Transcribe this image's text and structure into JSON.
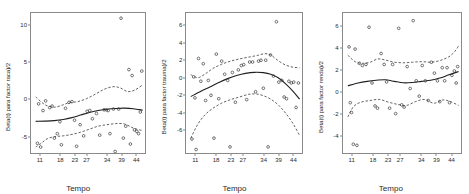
{
  "figure": {
    "type": "multi-panel-scatter-smooth",
    "panel_count": 3,
    "background": "#ffffff",
    "axis_color": "#8a8a8a",
    "fit_color": "#1f1f1f",
    "band_color": "#3a3a3a",
    "point_color": "#3a3a3a"
  },
  "chart_data": [
    {
      "type": "scatter",
      "title": "",
      "panel_index": 0,
      "ylabel": "Beta(t) para factor raca)/2",
      "xlabel": "Tempo",
      "xticks": [
        11,
        18,
        23,
        27,
        34,
        39,
        44
      ],
      "yticks": [
        -5,
        0,
        5,
        10
      ],
      "xlim": [
        8,
        47
      ],
      "ylim": [
        -7.2,
        11.6
      ],
      "grid": false,
      "legend": "none",
      "points": [
        {
          "x": 10.2,
          "y": -5.9
        },
        {
          "x": 10.6,
          "y": -0.6
        },
        {
          "x": 11.3,
          "y": -6.4
        },
        {
          "x": 12.1,
          "y": -1.5
        },
        {
          "x": 13.0,
          "y": -0.2
        },
        {
          "x": 14.4,
          "y": -1.1
        },
        {
          "x": 15.2,
          "y": -0.9
        },
        {
          "x": 16.0,
          "y": -5.2
        },
        {
          "x": 17.0,
          "y": -4.6
        },
        {
          "x": 17.9,
          "y": -3.0
        },
        {
          "x": 18.4,
          "y": -6.1
        },
        {
          "x": 19.8,
          "y": -1.2
        },
        {
          "x": 21.0,
          "y": -0.4
        },
        {
          "x": 22.0,
          "y": -0.3
        },
        {
          "x": 22.9,
          "y": -2.8
        },
        {
          "x": 23.6,
          "y": -6.3
        },
        {
          "x": 24.8,
          "y": -3.4
        },
        {
          "x": 26.0,
          "y": -4.9
        },
        {
          "x": 27.2,
          "y": -1.6
        },
        {
          "x": 28.1,
          "y": -1.5
        },
        {
          "x": 29.0,
          "y": -2.6
        },
        {
          "x": 30.4,
          "y": -1.9
        },
        {
          "x": 31.5,
          "y": -4.8
        },
        {
          "x": 33.0,
          "y": -1.4
        },
        {
          "x": 33.8,
          "y": -1.4
        },
        {
          "x": 34.4,
          "y": -1.5
        },
        {
          "x": 35.0,
          "y": -4.6
        },
        {
          "x": 36.2,
          "y": -1.3
        },
        {
          "x": 36.8,
          "y": -7.0
        },
        {
          "x": 38.0,
          "y": -1.3
        },
        {
          "x": 38.8,
          "y": 10.9
        },
        {
          "x": 39.6,
          "y": -5.2
        },
        {
          "x": 40.4,
          "y": -3.6
        },
        {
          "x": 41.5,
          "y": 4.0
        },
        {
          "x": 42.0,
          "y": -6.0
        },
        {
          "x": 42.6,
          "y": 3.2
        },
        {
          "x": 43.4,
          "y": -4.1
        },
        {
          "x": 44.2,
          "y": -4.3
        },
        {
          "x": 44.8,
          "y": -4.6
        },
        {
          "x": 45.4,
          "y": -1.7
        },
        {
          "x": 45.9,
          "y": 3.8
        }
      ],
      "fit": [
        {
          "x": 9.6,
          "y": -2.95
        },
        {
          "x": 13.0,
          "y": -2.92
        },
        {
          "x": 16.0,
          "y": -2.85
        },
        {
          "x": 19.0,
          "y": -2.7
        },
        {
          "x": 22.0,
          "y": -2.45
        },
        {
          "x": 25.0,
          "y": -2.1
        },
        {
          "x": 28.0,
          "y": -1.75
        },
        {
          "x": 31.0,
          "y": -1.5
        },
        {
          "x": 34.0,
          "y": -1.32
        },
        {
          "x": 37.0,
          "y": -1.22
        },
        {
          "x": 40.0,
          "y": -1.18
        },
        {
          "x": 43.0,
          "y": -1.25
        },
        {
          "x": 46.2,
          "y": -1.45
        }
      ],
      "upper_band": [
        {
          "x": 9.6,
          "y": 0.35
        },
        {
          "x": 11.5,
          "y": -0.35
        },
        {
          "x": 13.5,
          "y": -0.85
        },
        {
          "x": 16.0,
          "y": -1.05
        },
        {
          "x": 18.5,
          "y": -0.8
        },
        {
          "x": 21.0,
          "y": -0.45
        },
        {
          "x": 24.0,
          "y": -0.3
        },
        {
          "x": 27.0,
          "y": 0.1
        },
        {
          "x": 30.0,
          "y": 0.7
        },
        {
          "x": 33.0,
          "y": 1.35
        },
        {
          "x": 36.0,
          "y": 1.7
        },
        {
          "x": 38.5,
          "y": 1.55
        },
        {
          "x": 41.0,
          "y": 1.05
        },
        {
          "x": 43.5,
          "y": 1.25
        },
        {
          "x": 46.2,
          "y": 1.95
        }
      ],
      "lower_band": [
        {
          "x": 9.6,
          "y": -6.4
        },
        {
          "x": 11.5,
          "y": -5.9
        },
        {
          "x": 13.5,
          "y": -5.3
        },
        {
          "x": 16.0,
          "y": -5.0
        },
        {
          "x": 19.0,
          "y": -4.9
        },
        {
          "x": 22.0,
          "y": -4.7
        },
        {
          "x": 25.0,
          "y": -4.4
        },
        {
          "x": 28.0,
          "y": -4.0
        },
        {
          "x": 31.0,
          "y": -3.6
        },
        {
          "x": 34.0,
          "y": -3.4
        },
        {
          "x": 37.0,
          "y": -3.25
        },
        {
          "x": 40.0,
          "y": -3.3
        },
        {
          "x": 43.0,
          "y": -3.85
        },
        {
          "x": 46.2,
          "y": -4.2
        }
      ]
    },
    {
      "type": "scatter",
      "title": "",
      "panel_index": 1,
      "ylabel": "Beta(t) para factor trauma)/2",
      "xlabel": "Tempo",
      "xticks": [
        11,
        18,
        23,
        27,
        34,
        39,
        44
      ],
      "yticks": [
        -6,
        -4,
        -2,
        0,
        2,
        4,
        6
      ],
      "xlim": [
        8,
        47
      ],
      "ylim": [
        -8.6,
        7.4
      ],
      "grid": false,
      "legend": "none",
      "points": [
        {
          "x": 10.0,
          "y": -7.0
        },
        {
          "x": 10.6,
          "y": 0.1
        },
        {
          "x": 11.0,
          "y": -2.3
        },
        {
          "x": 11.4,
          "y": -8.2
        },
        {
          "x": 12.2,
          "y": 2.2
        },
        {
          "x": 13.0,
          "y": -0.4
        },
        {
          "x": 13.8,
          "y": 1.6
        },
        {
          "x": 14.6,
          "y": -2.6
        },
        {
          "x": 15.5,
          "y": -0.3
        },
        {
          "x": 16.4,
          "y": -2.0
        },
        {
          "x": 17.4,
          "y": -6.9
        },
        {
          "x": 18.2,
          "y": 2.7
        },
        {
          "x": 19.0,
          "y": -2.4
        },
        {
          "x": 20.0,
          "y": 1.9
        },
        {
          "x": 21.0,
          "y": 0.4
        },
        {
          "x": 22.0,
          "y": -0.3
        },
        {
          "x": 22.8,
          "y": -7.9
        },
        {
          "x": 23.6,
          "y": 0.6
        },
        {
          "x": 24.6,
          "y": -2.8
        },
        {
          "x": 25.6,
          "y": 0.9
        },
        {
          "x": 26.6,
          "y": 1.4
        },
        {
          "x": 27.4,
          "y": 1.5
        },
        {
          "x": 28.4,
          "y": -2.5
        },
        {
          "x": 29.4,
          "y": 1.8
        },
        {
          "x": 30.4,
          "y": 1.8
        },
        {
          "x": 31.4,
          "y": -1.6
        },
        {
          "x": 32.4,
          "y": 1.9
        },
        {
          "x": 33.2,
          "y": 2.0
        },
        {
          "x": 34.0,
          "y": -1.2
        },
        {
          "x": 34.8,
          "y": 2.0
        },
        {
          "x": 35.6,
          "y": -7.9
        },
        {
          "x": 36.4,
          "y": 2.6
        },
        {
          "x": 37.4,
          "y": 0.2
        },
        {
          "x": 38.4,
          "y": 6.4
        },
        {
          "x": 39.2,
          "y": -0.5
        },
        {
          "x": 40.2,
          "y": -0.3
        },
        {
          "x": 41.0,
          "y": -2.2
        },
        {
          "x": 41.8,
          "y": -2.4
        },
        {
          "x": 42.6,
          "y": -0.4
        },
        {
          "x": 43.4,
          "y": -0.6
        },
        {
          "x": 44.2,
          "y": -0.5
        },
        {
          "x": 45.0,
          "y": -3.4
        },
        {
          "x": 45.8,
          "y": -0.6
        }
      ],
      "fit": [
        {
          "x": 9.6,
          "y": -2.15
        },
        {
          "x": 13.0,
          "y": -1.55
        },
        {
          "x": 16.0,
          "y": -1.05
        },
        {
          "x": 19.0,
          "y": -0.55
        },
        {
          "x": 22.0,
          "y": -0.1
        },
        {
          "x": 25.0,
          "y": 0.25
        },
        {
          "x": 28.0,
          "y": 0.5
        },
        {
          "x": 31.0,
          "y": 0.62
        },
        {
          "x": 34.0,
          "y": 0.58
        },
        {
          "x": 36.5,
          "y": 0.4
        },
        {
          "x": 39.0,
          "y": 0.0
        },
        {
          "x": 41.5,
          "y": -0.7
        },
        {
          "x": 44.0,
          "y": -1.55
        },
        {
          "x": 46.2,
          "y": -2.45
        }
      ],
      "upper_band": [
        {
          "x": 9.6,
          "y": 0.35
        },
        {
          "x": 12.0,
          "y": 0.0
        },
        {
          "x": 14.5,
          "y": 0.45
        },
        {
          "x": 17.0,
          "y": 1.05
        },
        {
          "x": 20.0,
          "y": 1.55
        },
        {
          "x": 23.0,
          "y": 1.9
        },
        {
          "x": 26.0,
          "y": 2.15
        },
        {
          "x": 29.0,
          "y": 2.35
        },
        {
          "x": 32.0,
          "y": 2.55
        },
        {
          "x": 34.5,
          "y": 2.75
        },
        {
          "x": 36.5,
          "y": 2.6
        },
        {
          "x": 39.0,
          "y": 1.95
        },
        {
          "x": 41.5,
          "y": 1.45
        },
        {
          "x": 44.0,
          "y": 1.2
        },
        {
          "x": 46.2,
          "y": 1.15
        }
      ],
      "lower_band": [
        {
          "x": 9.6,
          "y": -6.9
        },
        {
          "x": 12.0,
          "y": -5.3
        },
        {
          "x": 14.5,
          "y": -4.2
        },
        {
          "x": 17.0,
          "y": -3.5
        },
        {
          "x": 20.0,
          "y": -2.9
        },
        {
          "x": 23.0,
          "y": -2.5
        },
        {
          "x": 26.0,
          "y": -2.2
        },
        {
          "x": 29.0,
          "y": -1.9
        },
        {
          "x": 31.5,
          "y": -1.85
        },
        {
          "x": 34.0,
          "y": -2.05
        },
        {
          "x": 36.5,
          "y": -2.45
        },
        {
          "x": 39.0,
          "y": -3.1
        },
        {
          "x": 41.5,
          "y": -4.05
        },
        {
          "x": 44.0,
          "y": -5.25
        },
        {
          "x": 46.2,
          "y": -6.6
        }
      ]
    },
    {
      "type": "scatter",
      "title": "",
      "panel_index": 2,
      "ylabel": "Beta(t) para factor renda)/2",
      "xlabel": "Tempo",
      "xticks": [
        11,
        18,
        23,
        27,
        34,
        39,
        44
      ],
      "yticks": [
        -4,
        -2,
        0,
        2,
        4,
        6
      ],
      "xlim": [
        8,
        47
      ],
      "ylim": [
        -5.6,
        7.2
      ],
      "grid": false,
      "legend": "none",
      "points": [
        {
          "x": 10.0,
          "y": 4.1
        },
        {
          "x": 10.4,
          "y": -1.0
        },
        {
          "x": 10.8,
          "y": -1.9
        },
        {
          "x": 11.4,
          "y": -4.8
        },
        {
          "x": 12.0,
          "y": 3.9
        },
        {
          "x": 12.6,
          "y": -4.9
        },
        {
          "x": 13.4,
          "y": 2.6
        },
        {
          "x": 14.4,
          "y": 2.4
        },
        {
          "x": 15.6,
          "y": 2.5
        },
        {
          "x": 16.6,
          "y": 5.9
        },
        {
          "x": 17.6,
          "y": 0.8
        },
        {
          "x": 18.6,
          "y": -1.3
        },
        {
          "x": 19.4,
          "y": -1.5
        },
        {
          "x": 20.6,
          "y": 3.5
        },
        {
          "x": 21.6,
          "y": 2.5
        },
        {
          "x": 22.4,
          "y": 0.9
        },
        {
          "x": 23.4,
          "y": -1.5
        },
        {
          "x": 24.4,
          "y": 2.5
        },
        {
          "x": 25.4,
          "y": -2.0
        },
        {
          "x": 26.4,
          "y": 5.8
        },
        {
          "x": 27.4,
          "y": -1.2
        },
        {
          "x": 28.2,
          "y": -1.4
        },
        {
          "x": 29.2,
          "y": 2.3
        },
        {
          "x": 30.2,
          "y": 0.3
        },
        {
          "x": 31.2,
          "y": 6.5
        },
        {
          "x": 32.2,
          "y": 1.0
        },
        {
          "x": 33.2,
          "y": -0.4
        },
        {
          "x": 34.2,
          "y": 2.4
        },
        {
          "x": 35.2,
          "y": 1.0
        },
        {
          "x": 36.2,
          "y": -0.8
        },
        {
          "x": 37.2,
          "y": 2.7
        },
        {
          "x": 38.2,
          "y": 1.7
        },
        {
          "x": 39.2,
          "y": 1.0
        },
        {
          "x": 40.0,
          "y": -0.9
        },
        {
          "x": 40.8,
          "y": 2.2
        },
        {
          "x": 41.6,
          "y": 1.0
        },
        {
          "x": 42.4,
          "y": 2.2
        },
        {
          "x": 43.2,
          "y": -1.0
        },
        {
          "x": 44.0,
          "y": 1.5
        },
        {
          "x": 44.8,
          "y": 1.9
        },
        {
          "x": 45.4,
          "y": 0.8
        },
        {
          "x": 45.9,
          "y": 2.3
        }
      ],
      "fit": [
        {
          "x": 9.6,
          "y": 0.55
        },
        {
          "x": 13.0,
          "y": 0.8
        },
        {
          "x": 16.0,
          "y": 0.95
        },
        {
          "x": 19.0,
          "y": 1.05
        },
        {
          "x": 22.0,
          "y": 1.1
        },
        {
          "x": 25.0,
          "y": 0.95
        },
        {
          "x": 28.0,
          "y": 0.82
        },
        {
          "x": 31.0,
          "y": 0.85
        },
        {
          "x": 34.0,
          "y": 0.95
        },
        {
          "x": 37.0,
          "y": 1.05
        },
        {
          "x": 40.0,
          "y": 1.25
        },
        {
          "x": 43.0,
          "y": 1.55
        },
        {
          "x": 46.2,
          "y": 1.85
        }
      ],
      "upper_band": [
        {
          "x": 9.6,
          "y": 3.35
        },
        {
          "x": 12.0,
          "y": 2.75
        },
        {
          "x": 14.5,
          "y": 2.6
        },
        {
          "x": 17.0,
          "y": 2.7
        },
        {
          "x": 19.5,
          "y": 3.0
        },
        {
          "x": 22.0,
          "y": 2.9
        },
        {
          "x": 25.0,
          "y": 2.7
        },
        {
          "x": 28.0,
          "y": 2.65
        },
        {
          "x": 31.0,
          "y": 2.7
        },
        {
          "x": 34.0,
          "y": 2.75
        },
        {
          "x": 37.0,
          "y": 2.7
        },
        {
          "x": 40.0,
          "y": 2.85
        },
        {
          "x": 43.0,
          "y": 3.2
        },
        {
          "x": 45.0,
          "y": 3.7
        },
        {
          "x": 46.2,
          "y": 4.2
        }
      ],
      "lower_band": [
        {
          "x": 9.6,
          "y": -2.3
        },
        {
          "x": 11.5,
          "y": -1.35
        },
        {
          "x": 14.0,
          "y": -0.95
        },
        {
          "x": 17.0,
          "y": -0.8
        },
        {
          "x": 20.0,
          "y": -0.7
        },
        {
          "x": 23.0,
          "y": -0.95
        },
        {
          "x": 26.0,
          "y": -1.15
        },
        {
          "x": 29.0,
          "y": -1.25
        },
        {
          "x": 32.0,
          "y": -0.9
        },
        {
          "x": 35.0,
          "y": -0.7
        },
        {
          "x": 38.0,
          "y": -1.05
        },
        {
          "x": 41.0,
          "y": -0.75
        },
        {
          "x": 43.5,
          "y": -0.9
        },
        {
          "x": 46.2,
          "y": -1.25
        }
      ]
    }
  ]
}
